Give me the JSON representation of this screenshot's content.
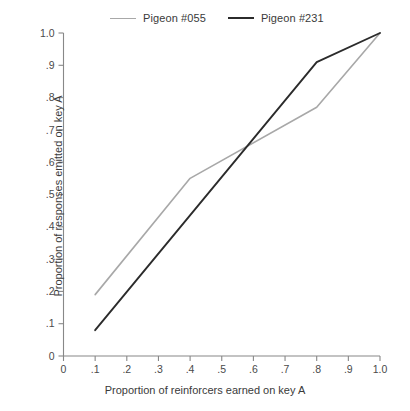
{
  "chart_data": {
    "type": "line",
    "title": "",
    "xlabel": "Proportion of reinforcers earned on key A",
    "ylabel": "Proportion of responses emitted on key A",
    "xlim": [
      0,
      1.0
    ],
    "ylim": [
      0,
      1.0
    ],
    "grid": false,
    "legend_position": "top",
    "xticks": [
      "0",
      ".1",
      ".2",
      ".3",
      ".4",
      ".5",
      ".6",
      ".7",
      ".8",
      ".9",
      "1.0"
    ],
    "xtick_values": [
      0,
      0.1,
      0.2,
      0.3,
      0.4,
      0.5,
      0.6,
      0.7,
      0.8,
      0.9,
      1.0
    ],
    "yticks": [
      "0",
      ".1",
      ".2",
      ".3",
      ".4",
      ".5",
      ".6",
      ".7",
      ".8",
      ".9",
      "1.0"
    ],
    "ytick_values": [
      0,
      0.1,
      0.2,
      0.3,
      0.4,
      0.5,
      0.6,
      0.7,
      0.8,
      0.9,
      1.0
    ],
    "series": [
      {
        "name": "Pigeon #055",
        "color": "#a8a8a8",
        "width": 1.6,
        "x": [
          0.1,
          0.4,
          0.8,
          1.0
        ],
        "values": [
          0.19,
          0.55,
          0.77,
          1.0
        ]
      },
      {
        "name": "Pigeon #231",
        "color": "#2b2b2b",
        "width": 1.9,
        "x": [
          0.1,
          0.8,
          1.0
        ],
        "values": [
          0.08,
          0.91,
          1.0
        ]
      }
    ]
  },
  "legend": {
    "entries": [
      {
        "label": "Pigeon #055"
      },
      {
        "label": "Pigeon #231"
      }
    ]
  },
  "axes": {
    "x_title": "Proportion of reinforcers earned on key A",
    "y_title": "Proportion of responses emitted on key A"
  },
  "colors": {
    "axis": "#888888",
    "text": "#3a3a3a",
    "series_1": "#a8a8a8",
    "series_2": "#2b2b2b",
    "background": "#ffffff"
  }
}
